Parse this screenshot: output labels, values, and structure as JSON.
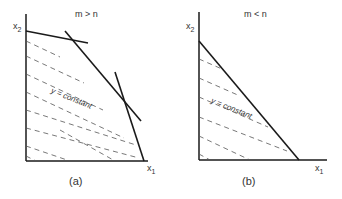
{
  "panels": [
    {
      "id": "a",
      "condition": "m > n",
      "y_axis_label": "x",
      "y_axis_sub": "2",
      "x_axis_label": "x",
      "x_axis_sub": "1",
      "region_label": "y = constant",
      "caption": "(a)"
    },
    {
      "id": "b",
      "condition": "m < n",
      "y_axis_label": "x",
      "y_axis_sub": "2",
      "x_axis_label": "x",
      "x_axis_sub": "1",
      "region_label": "y = constant",
      "caption": "(b)"
    }
  ],
  "colors": {
    "line": "#1a1a1a",
    "dashed": "#555555"
  }
}
